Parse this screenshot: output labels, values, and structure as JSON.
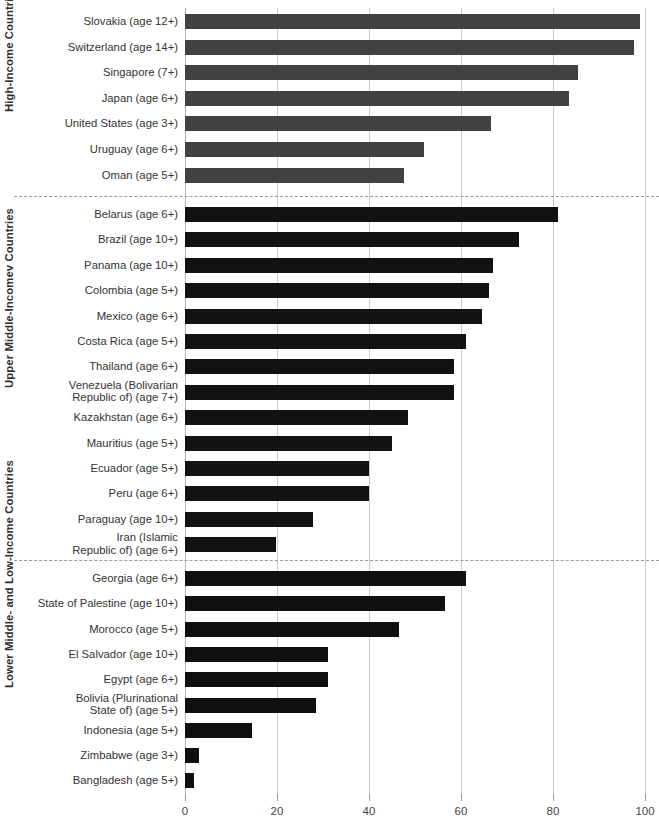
{
  "chart_data": {
    "type": "bar",
    "orientation": "horizontal",
    "title": "",
    "subtitle": "",
    "xlabel": "",
    "ylabel": "",
    "xlim": [
      0,
      100
    ],
    "xticks": [
      0,
      20,
      40,
      60,
      80,
      100
    ],
    "xtick_labels": [
      "0",
      "20",
      "40",
      "60",
      "80",
      "100"
    ],
    "grid": "vertical",
    "legend": "none",
    "colors": {
      "high_income_bar": "#414141",
      "upper_middle_income_bar": "#121212",
      "lower_income_bar": "#101010",
      "gridline": "#c9c9c9",
      "divider": "#9a9a9a",
      "label_text": "#333333"
    },
    "groups": [
      {
        "name": "high-income",
        "axis_title": "High-Income Countries",
        "bar_color": "#414141",
        "categories": [
          "Slovakia (age 12+)",
          "Switzerland (age 14+)",
          "Singapore (7+)",
          "Japan (age 6+)",
          "United States (age 3+)",
          "Uruguay (age 6+)",
          "Oman (age 5+)"
        ],
        "values": [
          99,
          97.5,
          85.5,
          83.5,
          66.5,
          52,
          47.5
        ]
      },
      {
        "name": "upper-middle-income",
        "axis_title": "Upper Middle-Incomev Countries",
        "bar_color": "#121212",
        "categories": [
          "Belarus (age 6+)",
          "Brazil (age 10+)",
          "Panama (age 10+)",
          "Colombia (age 5+)",
          "Mexico (age 6+)",
          "Costa Rica (age 5+)",
          "Thailand (age 6+)",
          "Venezuela (Bolivarian\nRepublic of) (age 7+)",
          "Kazakhstan (age 6+)",
          "Mauritius (age 5+)",
          "Ecuador (age 5+)",
          "Peru (age 6+)",
          "Paraguay (age 10+)",
          "Iran (Islamic\nRepublic of) (age 6+)"
        ],
        "values": [
          81,
          72.5,
          67,
          66,
          64.5,
          61,
          58.5,
          58.5,
          48.5,
          45,
          40,
          40,
          27.8,
          19.8
        ]
      },
      {
        "name": "lower-middle-and-low-income",
        "axis_title": "Lower Middle- and Low-Income Countries",
        "bar_color": "#101010",
        "categories": [
          "Georgia (age 6+)",
          "State of Palestine (age 10+)",
          "Morocco (age 5+)",
          "El Salvador (age 10+)",
          "Egypt (age 6+)",
          "Bolivia (Plurinational\nState of) (age 5+)",
          "Indonesia (age 5+)",
          "Zimbabwe (age 3+)",
          "Bangladesh (age 5+)"
        ],
        "values": [
          61,
          56.5,
          46.5,
          31,
          31,
          28.5,
          14.5,
          3,
          2
        ]
      }
    ]
  }
}
